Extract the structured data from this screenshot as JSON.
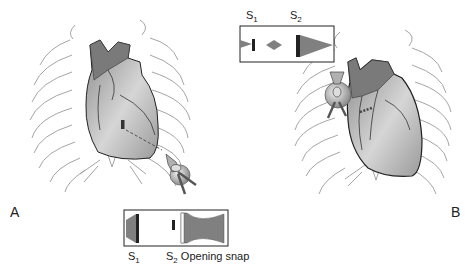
{
  "figure": {
    "panels": [
      {
        "id": "A",
        "label": "A"
      },
      {
        "id": "B",
        "label": "B"
      }
    ],
    "panel_a": {
      "phonogram": {
        "s1_label": "S",
        "s1_sub": "1",
        "s2_label": "S",
        "s2_sub": "2",
        "opening_snap_label": " Opening snap"
      }
    },
    "panel_b": {
      "phonogram": {
        "s1_label": "S",
        "s1_sub": "1",
        "s2_label": "S",
        "s2_sub": "2"
      }
    },
    "colors": {
      "heart_dark": "#7a7a7a",
      "heart_light": "#d8d8d8",
      "rib_line": "#9a9a9a",
      "sound_fill": "#808080",
      "sound_bar": "#222222"
    }
  }
}
